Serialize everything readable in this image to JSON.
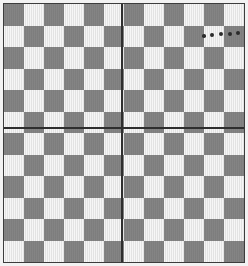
{
  "image": {
    "kind": "checkerboard-photo",
    "width": 248,
    "height": 266,
    "background_color": "#f2f2f2",
    "alt_text": "Photograph of a four-panel checkerboard calibration target with a row of small dark dots near the top right"
  },
  "frame": {
    "x": 3,
    "y": 3,
    "width": 242,
    "height": 260,
    "border_color": "#3c3c3c",
    "border_width": 1
  },
  "board": {
    "columns": 12,
    "rows": 12,
    "dark_color": "#808080",
    "light_color": "#ebebeb",
    "cell_width": 20.0,
    "cell_height": 21.5,
    "top_left_cell_color": "dark"
  },
  "quadrants": [
    {
      "name": "top-left",
      "columns": 6,
      "rows": 6
    },
    {
      "name": "top-right",
      "columns": 6,
      "rows": 6
    },
    {
      "name": "bottom-left",
      "columns": 6,
      "rows": 6
    },
    {
      "name": "bottom-right",
      "columns": 6,
      "rows": 6
    }
  ],
  "dividers": {
    "color": "#2e2e2e",
    "thickness": 2,
    "vertical_x": 121,
    "horizontal_y": 127
  },
  "dot_row": {
    "color": "#2b2b2b",
    "y": 35,
    "count": 6,
    "dots": [
      {
        "cx": 204,
        "cy": 36,
        "r": 1.8
      },
      {
        "cx": 212,
        "cy": 35,
        "r": 1.9
      },
      {
        "cx": 221,
        "cy": 34,
        "r": 2.0
      },
      {
        "cx": 230,
        "cy": 34,
        "r": 2.0
      },
      {
        "cx": 238,
        "cy": 33,
        "r": 2.0
      },
      {
        "cx": 246,
        "cy": 33,
        "r": 1.8
      }
    ]
  }
}
